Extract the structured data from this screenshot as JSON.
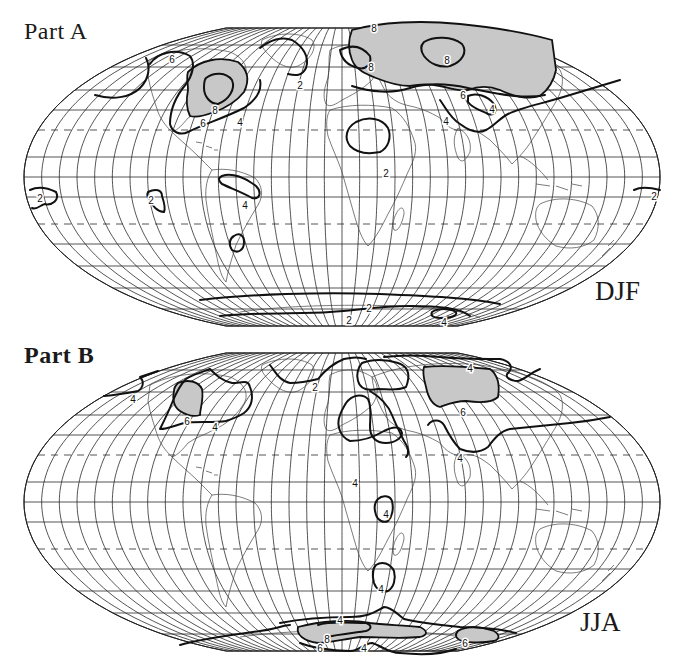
{
  "figure": {
    "panels": [
      {
        "id": "A",
        "label": "Part A",
        "season": "DJF",
        "contour_levels": [
          "2",
          "4",
          "6",
          "8"
        ],
        "shaded_threshold": "6",
        "contour_labels": [
          {
            "text": "6",
            "x": 172,
            "y": 49
          },
          {
            "text": "2",
            "x": 300,
            "y": 75
          },
          {
            "text": "8",
            "x": 215,
            "y": 100
          },
          {
            "text": "6",
            "x": 203,
            "y": 113
          },
          {
            "text": "4",
            "x": 240,
            "y": 112
          },
          {
            "text": "8",
            "x": 374,
            "y": 18
          },
          {
            "text": "8",
            "x": 371,
            "y": 57
          },
          {
            "text": "8",
            "x": 447,
            "y": 50
          },
          {
            "text": "6",
            "x": 463,
            "y": 85
          },
          {
            "text": "4",
            "x": 492,
            "y": 99
          },
          {
            "text": "4",
            "x": 446,
            "y": 111
          },
          {
            "text": "2",
            "x": 386,
            "y": 163
          },
          {
            "text": "4",
            "x": 245,
            "y": 195
          },
          {
            "text": "2",
            "x": 40,
            "y": 188
          },
          {
            "text": "2",
            "x": 151,
            "y": 190
          },
          {
            "text": "2",
            "x": 654,
            "y": 186
          },
          {
            "text": "2",
            "x": 369,
            "y": 298
          },
          {
            "text": "2",
            "x": 349,
            "y": 310
          },
          {
            "text": "4",
            "x": 444,
            "y": 312
          }
        ]
      },
      {
        "id": "B",
        "label": "Part B",
        "season": "JJA",
        "contour_levels": [
          "2",
          "4",
          "6",
          "8"
        ],
        "shaded_threshold": "6",
        "contour_labels": [
          {
            "text": "4",
            "x": 133,
            "y": 64
          },
          {
            "text": "4",
            "x": 215,
            "y": 92
          },
          {
            "text": "6",
            "x": 187,
            "y": 86
          },
          {
            "text": "2",
            "x": 315,
            "y": 52
          },
          {
            "text": "4",
            "x": 470,
            "y": 33
          },
          {
            "text": "6",
            "x": 463,
            "y": 77
          },
          {
            "text": "4",
            "x": 460,
            "y": 123
          },
          {
            "text": "4",
            "x": 355,
            "y": 148
          },
          {
            "text": "4",
            "x": 386,
            "y": 179
          },
          {
            "text": "4",
            "x": 381,
            "y": 254
          },
          {
            "text": "4",
            "x": 340,
            "y": 285
          },
          {
            "text": "8",
            "x": 327,
            "y": 304
          },
          {
            "text": "6",
            "x": 320,
            "y": 313
          },
          {
            "text": "4",
            "x": 364,
            "y": 313
          },
          {
            "text": "6",
            "x": 465,
            "y": 308
          }
        ]
      }
    ],
    "projection": {
      "type": "Flat-polar equal-area (Mollweide-like)",
      "meridian_spacing_deg": 10,
      "parallels": "15 deg spacing with dashed lines at the tropics"
    }
  },
  "chart_data": {
    "type": "map",
    "title": "",
    "panels": [
      {
        "label": "Part A",
        "season": "DJF",
        "contour_values_shown": [
          2,
          4,
          6,
          8
        ],
        "shaded_regions": "values >= 6",
        "features": [
          {
            "region": "North America (central/eastern US & Canada)",
            "max_contour": 8,
            "shaded": true
          },
          {
            "region": "Northern Eurasia / Siberia",
            "max_contour": 8,
            "shaded": true
          },
          {
            "region": "Europe / Scandinavia",
            "max_contour": 8,
            "shaded": true
          },
          {
            "region": "North Atlantic / Greenland",
            "max_contour": 2
          },
          {
            "region": "North Africa / Sahara",
            "max_contour": 2
          },
          {
            "region": "Amazon basin",
            "max_contour": 4
          },
          {
            "region": "Central Asia",
            "max_contour": 4
          },
          {
            "region": "Eastern Pacific (tropics)",
            "max_contour": 2
          },
          {
            "region": "Western Pacific",
            "max_contour": 2
          },
          {
            "region": "Southern Ocean / Antarctica",
            "max_contour": 4
          }
        ]
      },
      {
        "label": "Part B",
        "season": "JJA",
        "contour_values_shown": [
          2,
          4,
          6,
          8
        ],
        "shaded_regions": "values >= 6",
        "features": [
          {
            "region": "Western North America",
            "max_contour": 6,
            "shaded": true
          },
          {
            "region": "Central Asia / Siberia",
            "max_contour": 6,
            "shaded": true
          },
          {
            "region": "North Atlantic / Greenland",
            "max_contour": 2
          },
          {
            "region": "Mediterranean / Europe / North Africa",
            "max_contour": 4
          },
          {
            "region": "Central Africa",
            "max_contour": 4
          },
          {
            "region": "Southern Africa",
            "max_contour": 4
          },
          {
            "region": "Antarctica (East)",
            "max_contour": 8,
            "shaded": true
          },
          {
            "region": "Antarctica (West/Ross)",
            "max_contour": 6,
            "shaded": true
          }
        ]
      }
    ],
    "legend": "Contour labels 2, 4, 6, 8; shading marks values of 6 and above",
    "grid": true
  }
}
